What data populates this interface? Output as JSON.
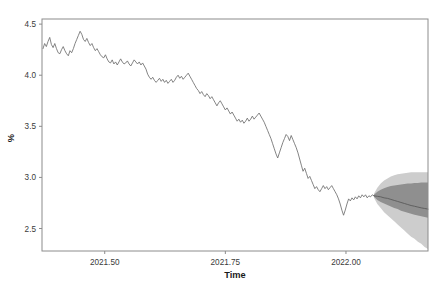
{
  "chart_data": {
    "type": "line",
    "title": "",
    "xlabel": "Time",
    "ylabel": "%",
    "xlim": [
      2021.37,
      2022.17
    ],
    "ylim": [
      2.28,
      4.55
    ],
    "grid": false,
    "legend": null,
    "xticks": [
      2021.5,
      2021.75,
      2022.0
    ],
    "xticklabels": [
      "2021.50",
      "2021.75",
      "2022.00"
    ],
    "yticks": [
      2.5,
      3.0,
      3.5,
      4.0,
      4.5
    ],
    "yticklabels": [
      "2.5",
      "3.0",
      "3.5",
      "4.0",
      "4.5"
    ],
    "colors": {
      "series_line": "#6e6e6e",
      "forecast_line": "#5a5a5a",
      "band_80": "#8f8f8f",
      "band_95": "#cdcdcd",
      "frame": "#8c8c8c",
      "text": "#1a1a1a"
    },
    "series": [
      {
        "name": "observed",
        "x": [
          2021.372,
          2021.3755,
          2021.379,
          2021.3825,
          2021.386,
          2021.3895,
          2021.393,
          2021.3965,
          2021.4,
          2021.4035,
          2021.407,
          2021.4105,
          2021.414,
          2021.4175,
          2021.421,
          2021.4245,
          2021.428,
          2021.4315,
          2021.435,
          2021.4385,
          2021.442,
          2021.4455,
          2021.449,
          2021.4525,
          2021.456,
          2021.4595,
          2021.463,
          2021.4665,
          2021.47,
          2021.4735,
          2021.477,
          2021.4805,
          2021.484,
          2021.4875,
          2021.491,
          2021.4945,
          2021.498,
          2021.5015,
          2021.505,
          2021.5085,
          2021.512,
          2021.5155,
          2021.519,
          2021.5225,
          2021.526,
          2021.5295,
          2021.533,
          2021.5365,
          2021.54,
          2021.5435,
          2021.547,
          2021.5505,
          2021.554,
          2021.5575,
          2021.561,
          2021.5645,
          2021.568,
          2021.5715,
          2021.575,
          2021.5785,
          2021.582,
          2021.5855,
          2021.589,
          2021.5925,
          2021.596,
          2021.5995,
          2021.603,
          2021.6065,
          2021.61,
          2021.6135,
          2021.617,
          2021.6205,
          2021.624,
          2021.6275,
          2021.631,
          2021.6345,
          2021.638,
          2021.6415,
          2021.645,
          2021.6485,
          2021.652,
          2021.6555,
          2021.659,
          2021.6625,
          2021.666,
          2021.6695,
          2021.673,
          2021.6765,
          2021.68,
          2021.6835,
          2021.687,
          2021.6905,
          2021.694,
          2021.6975,
          2021.701,
          2021.7045,
          2021.708,
          2021.7115,
          2021.715,
          2021.7185,
          2021.722,
          2021.7255,
          2021.729,
          2021.7325,
          2021.736,
          2021.7395,
          2021.743,
          2021.7465,
          2021.75,
          2021.7535,
          2021.757,
          2021.7605,
          2021.764,
          2021.7675,
          2021.771,
          2021.7745,
          2021.778,
          2021.7815,
          2021.785,
          2021.7885,
          2021.792,
          2021.7955,
          2021.799,
          2021.8025,
          2021.806,
          2021.8095,
          2021.813,
          2021.8165,
          2021.82,
          2021.8235,
          2021.827,
          2021.8305,
          2021.834,
          2021.8375,
          2021.841,
          2021.8445,
          2021.848,
          2021.8515,
          2021.855,
          2021.8585,
          2021.862,
          2021.8655,
          2021.869,
          2021.8725,
          2021.876,
          2021.8795,
          2021.883,
          2021.8865,
          2021.89,
          2021.8935,
          2021.897,
          2021.9005,
          2021.904,
          2021.9075,
          2021.911,
          2021.9145,
          2021.918,
          2021.9215,
          2021.925,
          2021.9285,
          2021.932,
          2021.9355,
          2021.939,
          2021.9425,
          2021.946,
          2021.9495,
          2021.953,
          2021.9565,
          2021.96,
          2021.9635,
          2021.967,
          2021.9705,
          2021.974,
          2021.9775,
          2021.981,
          2021.9845,
          2021.988,
          2021.9915,
          2021.995,
          2021.9985,
          2022.002,
          2022.0055,
          2022.009,
          2022.0125,
          2022.016,
          2022.0195,
          2022.023,
          2022.0265,
          2022.03,
          2022.0335,
          2022.037,
          2022.0405,
          2022.044,
          2022.0475,
          2022.051,
          2022.0545,
          2022.058
        ],
        "y": [
          4.26,
          4.31,
          4.28,
          4.33,
          4.37,
          4.3,
          4.27,
          4.31,
          4.26,
          4.22,
          4.21,
          4.25,
          4.28,
          4.24,
          4.21,
          4.19,
          4.24,
          4.22,
          4.26,
          4.31,
          4.35,
          4.39,
          4.43,
          4.4,
          4.35,
          4.33,
          4.36,
          4.32,
          4.29,
          4.31,
          4.27,
          4.24,
          4.26,
          4.23,
          4.2,
          4.18,
          4.17,
          4.2,
          4.16,
          4.13,
          4.12,
          4.15,
          4.11,
          4.13,
          4.1,
          4.13,
          4.16,
          4.13,
          4.11,
          4.12,
          4.14,
          4.11,
          4.09,
          4.12,
          4.15,
          4.13,
          4.11,
          4.13,
          4.1,
          4.12,
          4.09,
          4.06,
          4.01,
          3.98,
          3.96,
          3.98,
          3.95,
          3.93,
          3.95,
          3.97,
          3.94,
          3.96,
          3.93,
          3.95,
          3.92,
          3.94,
          3.96,
          3.93,
          3.95,
          3.98,
          4.0,
          3.97,
          3.99,
          3.96,
          3.98,
          4.0,
          4.02,
          3.99,
          3.96,
          3.93,
          3.9,
          3.87,
          3.85,
          3.82,
          3.84,
          3.81,
          3.79,
          3.82,
          3.8,
          3.77,
          3.79,
          3.76,
          3.73,
          3.7,
          3.73,
          3.75,
          3.72,
          3.69,
          3.66,
          3.68,
          3.65,
          3.62,
          3.64,
          3.61,
          3.58,
          3.55,
          3.57,
          3.54,
          3.56,
          3.53,
          3.55,
          3.58,
          3.55,
          3.57,
          3.6,
          3.57,
          3.59,
          3.61,
          3.63,
          3.6,
          3.57,
          3.54,
          3.5,
          3.46,
          3.42,
          3.38,
          3.33,
          3.28,
          3.23,
          3.19,
          3.24,
          3.29,
          3.34,
          3.38,
          3.42,
          3.4,
          3.36,
          3.41,
          3.37,
          3.33,
          3.29,
          3.24,
          3.18,
          3.12,
          3.06,
          3.09,
          3.04,
          2.99,
          3.01,
          2.97,
          2.93,
          2.89,
          2.91,
          2.88,
          2.86,
          2.89,
          2.92,
          2.89,
          2.91,
          2.88,
          2.9,
          2.92,
          2.89,
          2.86,
          2.83,
          2.79,
          2.74,
          2.68,
          2.63,
          2.68,
          2.74,
          2.79,
          2.77,
          2.8,
          2.78,
          2.81,
          2.79,
          2.82,
          2.8,
          2.83,
          2.81,
          2.83,
          2.8,
          2.82,
          2.81,
          2.83,
          2.82
        ]
      },
      {
        "name": "forecast_median",
        "x": [
          2022.058,
          2022.065,
          2022.072,
          2022.079,
          2022.086,
          2022.093,
          2022.1,
          2022.107,
          2022.114,
          2022.121,
          2022.128,
          2022.135,
          2022.142,
          2022.149,
          2022.156,
          2022.163,
          2022.17
        ],
        "y": [
          2.82,
          2.815,
          2.81,
          2.8,
          2.795,
          2.785,
          2.775,
          2.765,
          2.755,
          2.745,
          2.735,
          2.725,
          2.718,
          2.71,
          2.702,
          2.696,
          2.69
        ]
      }
    ],
    "intervals": [
      {
        "name": "95% interval",
        "level": 95,
        "color": "#cdcdcd",
        "x": [
          2022.058,
          2022.065,
          2022.072,
          2022.079,
          2022.086,
          2022.093,
          2022.1,
          2022.107,
          2022.114,
          2022.121,
          2022.128,
          2022.135,
          2022.142,
          2022.149,
          2022.156,
          2022.163,
          2022.17
        ],
        "upper": [
          2.84,
          2.9,
          2.94,
          2.97,
          2.99,
          3.01,
          3.02,
          3.03,
          3.035,
          3.04,
          3.045,
          3.05,
          3.05,
          3.05,
          3.05,
          3.05,
          3.05
        ],
        "lower": [
          2.8,
          2.74,
          2.7,
          2.66,
          2.63,
          2.6,
          2.57,
          2.54,
          2.51,
          2.48,
          2.45,
          2.42,
          2.4,
          2.37,
          2.35,
          2.32,
          2.3
        ]
      },
      {
        "name": "80% interval",
        "level": 80,
        "color": "#8f8f8f",
        "x": [
          2022.058,
          2022.065,
          2022.072,
          2022.079,
          2022.086,
          2022.093,
          2022.1,
          2022.107,
          2022.114,
          2022.121,
          2022.128,
          2022.135,
          2022.142,
          2022.149,
          2022.156,
          2022.163,
          2022.17
        ],
        "upper": [
          2.83,
          2.86,
          2.88,
          2.895,
          2.905,
          2.915,
          2.92,
          2.925,
          2.93,
          2.935,
          2.94,
          2.94,
          2.945,
          2.945,
          2.95,
          2.95,
          2.95
        ],
        "lower": [
          2.81,
          2.78,
          2.76,
          2.745,
          2.73,
          2.715,
          2.7,
          2.69,
          2.675,
          2.665,
          2.655,
          2.645,
          2.635,
          2.628,
          2.62,
          2.612,
          2.605
        ]
      }
    ]
  },
  "axes": {
    "x_title": "Time",
    "y_title": "%"
  }
}
